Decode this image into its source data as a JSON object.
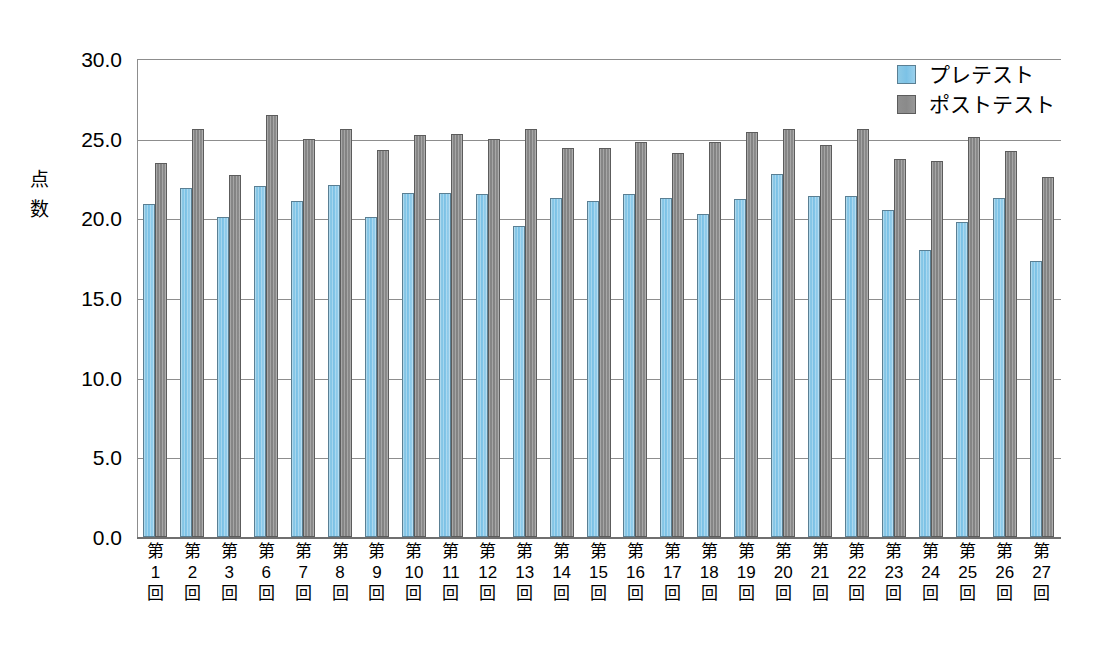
{
  "chart_data": {
    "type": "bar",
    "title": "",
    "xlabel": "",
    "ylabel": "点数",
    "ylim": [
      0.0,
      30.0
    ],
    "ytick_labels": [
      "30.0",
      "25.0",
      "20.0",
      "15.0",
      "10.0",
      "5.0",
      "0.0"
    ],
    "ytick_values": [
      30.0,
      25.0,
      20.0,
      15.0,
      10.0,
      5.0,
      0.0
    ],
    "grid": true,
    "legend_position": "top-right",
    "categories": [
      "第1回",
      "第2回",
      "第3回",
      "第6回",
      "第7回",
      "第8回",
      "第9回",
      "第10回",
      "第11回",
      "第12回",
      "第13回",
      "第14回",
      "第15回",
      "第16回",
      "第17回",
      "第18回",
      "第19回",
      "第20回",
      "第21回",
      "第22回",
      "第23回",
      "第24回",
      "第25回",
      "第26回",
      "第27回"
    ],
    "category_parts": [
      {
        "prefix": "第",
        "number": "1",
        "suffix": "回"
      },
      {
        "prefix": "第",
        "number": "2",
        "suffix": "回"
      },
      {
        "prefix": "第",
        "number": "3",
        "suffix": "回"
      },
      {
        "prefix": "第",
        "number": "6",
        "suffix": "回"
      },
      {
        "prefix": "第",
        "number": "7",
        "suffix": "回"
      },
      {
        "prefix": "第",
        "number": "8",
        "suffix": "回"
      },
      {
        "prefix": "第",
        "number": "9",
        "suffix": "回"
      },
      {
        "prefix": "第",
        "number": "10",
        "suffix": "回"
      },
      {
        "prefix": "第",
        "number": "11",
        "suffix": "回"
      },
      {
        "prefix": "第",
        "number": "12",
        "suffix": "回"
      },
      {
        "prefix": "第",
        "number": "13",
        "suffix": "回"
      },
      {
        "prefix": "第",
        "number": "14",
        "suffix": "回"
      },
      {
        "prefix": "第",
        "number": "15",
        "suffix": "回"
      },
      {
        "prefix": "第",
        "number": "16",
        "suffix": "回"
      },
      {
        "prefix": "第",
        "number": "17",
        "suffix": "回"
      },
      {
        "prefix": "第",
        "number": "18",
        "suffix": "回"
      },
      {
        "prefix": "第",
        "number": "19",
        "suffix": "回"
      },
      {
        "prefix": "第",
        "number": "20",
        "suffix": "回"
      },
      {
        "prefix": "第",
        "number": "21",
        "suffix": "回"
      },
      {
        "prefix": "第",
        "number": "22",
        "suffix": "回"
      },
      {
        "prefix": "第",
        "number": "23",
        "suffix": "回"
      },
      {
        "prefix": "第",
        "number": "24",
        "suffix": "回"
      },
      {
        "prefix": "第",
        "number": "25",
        "suffix": "回"
      },
      {
        "prefix": "第",
        "number": "26",
        "suffix": "回"
      },
      {
        "prefix": "第",
        "number": "27",
        "suffix": "回"
      }
    ],
    "series": [
      {
        "name": "プレテスト",
        "color": "#7cc2e6",
        "values": [
          20.9,
          21.9,
          20.1,
          22.0,
          21.1,
          22.1,
          20.1,
          21.6,
          21.6,
          21.5,
          19.5,
          21.3,
          21.1,
          21.5,
          21.3,
          20.3,
          21.2,
          22.8,
          21.4,
          21.4,
          20.5,
          18.0,
          19.8,
          21.3,
          17.3
        ]
      },
      {
        "name": "ポストテスト",
        "color": "#8a8a8a",
        "values": [
          23.5,
          25.6,
          22.7,
          26.5,
          25.0,
          25.6,
          24.3,
          25.2,
          25.3,
          25.0,
          25.6,
          24.4,
          24.4,
          24.8,
          24.1,
          24.8,
          25.4,
          25.6,
          24.6,
          25.6,
          23.7,
          23.6,
          25.1,
          24.2,
          22.6
        ]
      }
    ]
  },
  "legend": {
    "items": [
      {
        "label": "プレテスト"
      },
      {
        "label": "ポストテスト"
      }
    ]
  },
  "y_axis": {
    "title_chars": [
      "点",
      "数"
    ]
  }
}
